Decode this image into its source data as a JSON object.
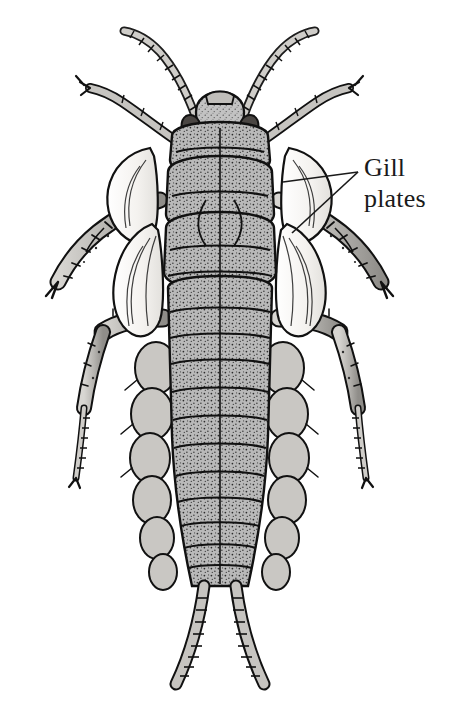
{
  "figure": {
    "view": "dorsal",
    "style": "grayscale stipple line illustration",
    "background_color": "#ffffff",
    "ink_color": "#1a1a1a",
    "body_fill": "#b8b8b8",
    "gill_fill": "#f2f0ec",
    "eye_fill": "#4a4643",
    "annotations": [
      {
        "id": "gill-plates",
        "line1": "Gill",
        "line2": "plates",
        "text_x": 364,
        "text_y": 152,
        "leaders": [
          {
            "from_x": 358,
            "from_y": 172,
            "to_x": 283,
            "to_y": 182
          },
          {
            "from_x": 358,
            "from_y": 172,
            "to_x": 292,
            "to_y": 233
          }
        ]
      }
    ],
    "parts": {
      "antennae": 2,
      "legs": 6,
      "cerci": 2,
      "abdominal_segments": 10,
      "gill_plate_pairs": 7
    }
  }
}
